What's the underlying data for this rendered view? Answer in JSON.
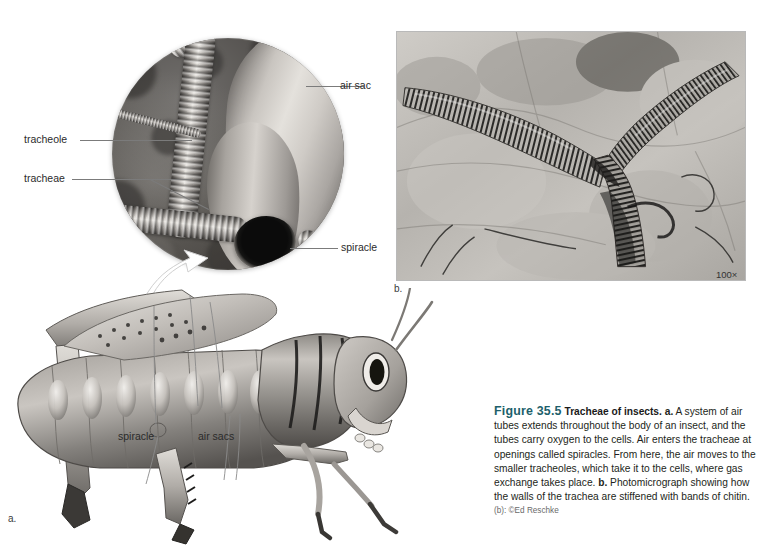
{
  "figure": {
    "number": "Figure 35.5",
    "title": "Tracheae of insects.",
    "caption_a_marker": "a.",
    "caption_a": " A system of air tubes extends throughout the body of an insect, and the tubes carry oxygen to the cells. Air enters the tracheae at openings called spiracles. From here, the air moves to the smaller tracheoles, which take it to the cells, where gas exchange takes place. ",
    "caption_b_marker": "b.",
    "caption_b": " Photomicrograph showing how the walls of the trachea are stiffened with bands of chitin.",
    "credit": "(b): ©Ed Reschke",
    "title_color": "#1d5f6b"
  },
  "panel_a": {
    "panel_label": "a.",
    "inset_labels": [
      {
        "id": "air-sac",
        "text": "air sac"
      },
      {
        "id": "tracheole",
        "text": "tracheole"
      },
      {
        "id": "tracheae",
        "text": "tracheae"
      },
      {
        "id": "spiracle",
        "text": "spiracle"
      }
    ],
    "insect_labels": [
      {
        "id": "spiracle",
        "text": "spiracle"
      },
      {
        "id": "air-sacs",
        "text": "air sacs"
      }
    ],
    "subject": "grasshopper-illustration"
  },
  "panel_b": {
    "panel_label": "b.",
    "magnification": "100×",
    "subject": "photomicrograph-of-trachea"
  },
  "header_ghost": {
    "line1": "",
    "line2": ""
  }
}
